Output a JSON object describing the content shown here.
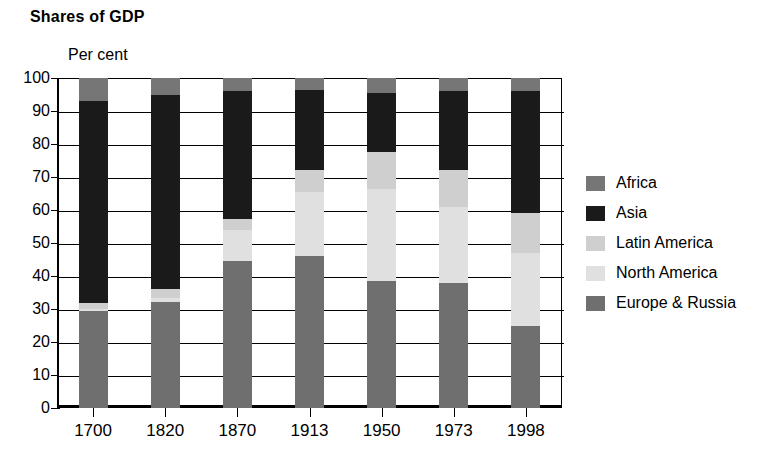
{
  "chart_data": {
    "type": "bar",
    "title": "Shares of GDP",
    "subtitle": "",
    "xlabel": "",
    "ylabel": "Per cent",
    "ylim": [
      0,
      100
    ],
    "yticks": [
      0,
      10,
      20,
      30,
      40,
      50,
      60,
      70,
      80,
      90,
      100
    ],
    "ytick_labels": [
      "0",
      "10",
      "20",
      "30",
      "40",
      "50",
      "60",
      "70",
      "80",
      "90",
      "100"
    ],
    "grid": true,
    "stacked": true,
    "legend_position": "right",
    "categories": [
      "1700",
      "1820",
      "1870",
      "1913",
      "1950",
      "1973",
      "1998"
    ],
    "series": [
      {
        "name": "Europe & Russia",
        "color": "#6f6f6f",
        "values": [
          29.5,
          32.0,
          44.5,
          46.0,
          38.5,
          38.0,
          25.0
        ]
      },
      {
        "name": "North America",
        "color": "#e0e0e0",
        "values": [
          0.6,
          1.2,
          9.5,
          19.5,
          28.0,
          23.0,
          22.0
        ]
      },
      {
        "name": "Latin America",
        "color": "#cfcfcf",
        "values": [
          1.6,
          2.8,
          3.4,
          6.5,
          11.0,
          11.0,
          12.0
        ]
      },
      {
        "name": "Asia",
        "color": "#1a1a1a",
        "values": [
          61.3,
          59.0,
          38.6,
          24.5,
          18.0,
          24.0,
          37.0
        ]
      },
      {
        "name": "Africa",
        "color": "#767676",
        "values": [
          7.0,
          5.0,
          4.0,
          3.5,
          4.5,
          4.0,
          4.0
        ]
      }
    ],
    "legend_order": [
      "Africa",
      "Asia",
      "Latin America",
      "North America",
      "Europe & Russia"
    ],
    "segment_boundaries_percent": {
      "1700": {
        "europe_russia_top": 29.5,
        "north_america_top": 30.1,
        "latin_america_top": 31.7,
        "asia_top": 93.0,
        "africa_top": 100
      },
      "1820": {
        "europe_russia_top": 32.0,
        "north_america_top": 33.2,
        "latin_america_top": 36.0,
        "asia_top": 95.0,
        "africa_top": 100
      },
      "1870": {
        "europe_russia_top": 44.5,
        "north_america_top": 54.0,
        "latin_america_top": 57.4,
        "asia_top": 96.0,
        "africa_top": 100
      },
      "1913": {
        "europe_russia_top": 46.0,
        "north_america_top": 65.5,
        "latin_america_top": 72.0,
        "asia_top": 96.5,
        "africa_top": 100
      },
      "1950": {
        "europe_russia_top": 38.5,
        "north_america_top": 66.5,
        "latin_america_top": 77.5,
        "asia_top": 95.5,
        "africa_top": 100
      },
      "1973": {
        "europe_russia_top": 38.0,
        "north_america_top": 61.0,
        "latin_america_top": 72.0,
        "asia_top": 96.0,
        "africa_top": 100
      },
      "1998": {
        "europe_russia_top": 25.0,
        "north_america_top": 47.0,
        "latin_america_top": 59.0,
        "asia_top": 96.0,
        "africa_top": 100
      }
    }
  }
}
